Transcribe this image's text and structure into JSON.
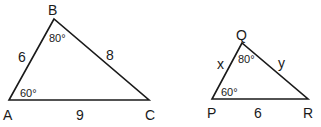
{
  "diagram": {
    "triangle1": {
      "vertices": {
        "A": "A",
        "B": "B",
        "C": "C"
      },
      "sides": {
        "AB": "6",
        "BC": "8",
        "AC": "9"
      },
      "angles": {
        "B": "80°",
        "A": "60°"
      }
    },
    "triangle2": {
      "vertices": {
        "P": "P",
        "Q": "Q",
        "R": "R"
      },
      "sides": {
        "PQ": "x",
        "QR": "y",
        "PR": "6"
      },
      "angles": {
        "Q": "80°",
        "P": "60°"
      }
    },
    "line_color": "#1a1a1a"
  }
}
